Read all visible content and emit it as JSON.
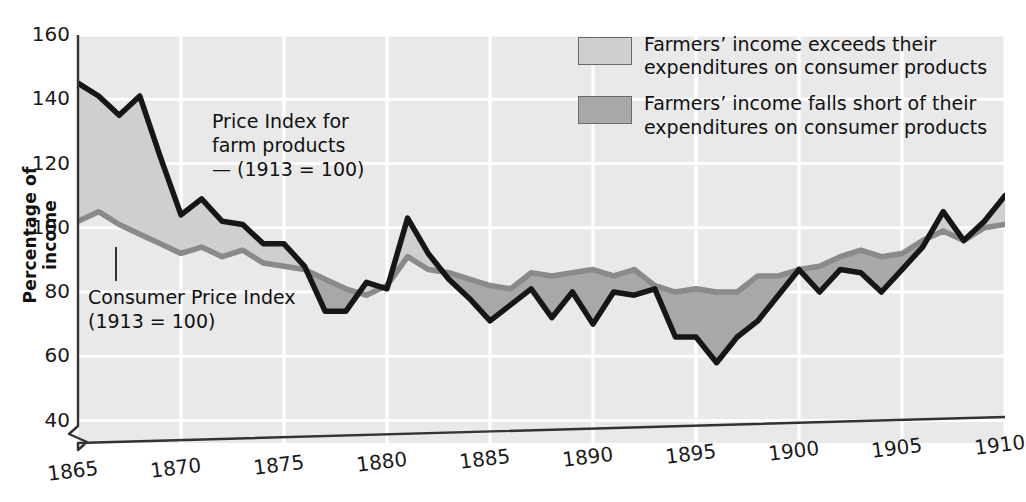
{
  "axes": {
    "ylabel": "Percentage of income",
    "yticks": [
      160,
      140,
      120,
      100,
      80,
      60,
      40
    ],
    "xticks": [
      1865,
      1870,
      1875,
      1880,
      1885,
      1890,
      1895,
      1900,
      1905,
      1910
    ],
    "axis_break": "axis-break-icon"
  },
  "annotations": {
    "farm": "Price Index for\nfarm products\n— (1913 = 100)",
    "cpi": "Consumer Price Index\n(1913 = 100)"
  },
  "legend": {
    "items": [
      {
        "swatch": "#cfcfcf",
        "text": "Farmers’ income exceeds their\nexpenditures on consumer products"
      },
      {
        "swatch": "#a8a8a8",
        "text": "Farmers’ income falls short of their\nexpenditures on consumer products"
      }
    ]
  },
  "colors": {
    "plot_background": "#e9e9e9",
    "gridline": "#ffffff",
    "farm_line": "#161616",
    "cpi_line": "#8a8a8a",
    "fill_exceeds": "#cfcfcf",
    "fill_short": "#a8a8a8"
  },
  "chart_data": {
    "type": "line",
    "title": "",
    "xlabel": "",
    "ylabel": "Percentage of income",
    "xlim": [
      1865,
      1910
    ],
    "ylim": [
      33,
      160
    ],
    "grid": true,
    "legend_position": "top-right",
    "x": [
      1865,
      1866,
      1867,
      1868,
      1869,
      1870,
      1871,
      1872,
      1873,
      1874,
      1875,
      1876,
      1877,
      1878,
      1879,
      1880,
      1881,
      1882,
      1883,
      1884,
      1885,
      1886,
      1887,
      1888,
      1889,
      1890,
      1891,
      1892,
      1893,
      1894,
      1895,
      1896,
      1897,
      1898,
      1899,
      1900,
      1901,
      1902,
      1903,
      1904,
      1905,
      1906,
      1907,
      1908,
      1909,
      1910
    ],
    "series": [
      {
        "name": "Price Index for farm products (1913 = 100)",
        "color": "#161616",
        "values": [
          145,
          141,
          135,
          141,
          122,
          104,
          109,
          102,
          101,
          95,
          95,
          88,
          74,
          74,
          83,
          81,
          103,
          92,
          84,
          78,
          71,
          76,
          81,
          72,
          80,
          70,
          80,
          79,
          81,
          66,
          66,
          58,
          66,
          71,
          79,
          87,
          80,
          87,
          86,
          80,
          87,
          94,
          105,
          96,
          102,
          110
        ]
      },
      {
        "name": "Consumer Price Index (1913 = 100)",
        "color": "#8a8a8a",
        "values": [
          102,
          105,
          101,
          98,
          95,
          92,
          94,
          91,
          93,
          89,
          88,
          87,
          84,
          81,
          79,
          82,
          91,
          87,
          86,
          84,
          82,
          81,
          86,
          85,
          86,
          87,
          85,
          87,
          82,
          80,
          81,
          80,
          80,
          85,
          85,
          87,
          88,
          91,
          93,
          91,
          92,
          96,
          99,
          96,
          100,
          101
        ]
      }
    ],
    "band_annotation": {
      "exceeds_label": "Farmers’ income exceeds their expenditures on consumer products",
      "short_label": "Farmers’ income falls short of their expenditures on consumer products"
    }
  }
}
